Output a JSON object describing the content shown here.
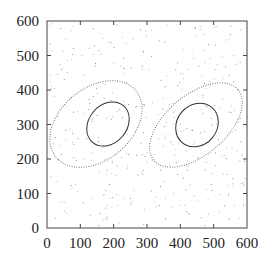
{
  "chart_data": {
    "type": "scatter",
    "title": "",
    "xlabel": "",
    "ylabel": "",
    "xlim": [
      0,
      600
    ],
    "ylim": [
      0,
      600
    ],
    "grid": false,
    "legend": null,
    "x_ticks": [
      "0",
      "100",
      "200",
      "300",
      "400",
      "500",
      "600"
    ],
    "y_ticks": [
      "0",
      "100",
      "200",
      "300",
      "400",
      "500",
      "600"
    ],
    "x_tick_values": [
      0,
      100,
      200,
      300,
      400,
      500,
      600
    ],
    "y_tick_values": [
      0,
      100,
      200,
      300,
      400,
      500,
      600
    ],
    "series": [
      {
        "name": "scattered points",
        "style": "small gray dots",
        "description": "approximately uniform random points over [0,600]x[0,600]"
      },
      {
        "name": "left cluster inner contour",
        "style": "solid",
        "center": [
          185,
          300
        ],
        "extent_x": [
          115,
          250
        ],
        "extent_y": [
          235,
          365
        ]
      },
      {
        "name": "left cluster outer contour",
        "style": "dotted",
        "center": [
          150,
          300
        ],
        "extent_x": [
          20,
          280
        ],
        "extent_y": [
          145,
          460
        ],
        "tilt_deg": 40
      },
      {
        "name": "right cluster inner contour",
        "style": "solid",
        "center": [
          450,
          300
        ],
        "extent_x": [
          385,
          515
        ],
        "extent_y": [
          240,
          360
        ]
      },
      {
        "name": "right cluster outer contour",
        "style": "dotted",
        "center": [
          450,
          295
        ],
        "extent_x": [
          310,
          585
        ],
        "extent_y": [
          165,
          435
        ],
        "tilt_deg": 40
      }
    ]
  }
}
